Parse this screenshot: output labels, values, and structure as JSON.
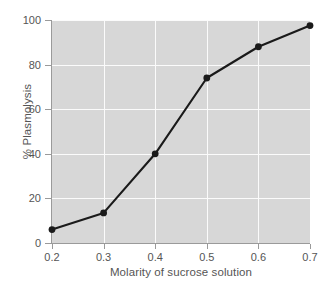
{
  "chart_data": {
    "type": "line",
    "title": "",
    "xlabel": "Molarity of sucrose solution",
    "ylabel": "% Plasmolysis",
    "x": [
      0.2,
      0.3,
      0.4,
      0.5,
      0.6,
      0.7
    ],
    "values": [
      6,
      13.5,
      40,
      74,
      88,
      97.5
    ],
    "series": [
      {
        "name": "% Plasmolysis",
        "values": [
          6,
          13.5,
          40,
          74,
          88,
          97.5
        ]
      }
    ],
    "xlim": [
      0.2,
      0.7
    ],
    "ylim": [
      0,
      100
    ],
    "xticks": [
      0.2,
      0.3,
      0.4,
      0.5,
      0.6,
      0.7
    ],
    "yticks": [
      0,
      20,
      40,
      60,
      80,
      100
    ],
    "xticklabels": [
      "0.2",
      "0.3",
      "0.4",
      "0.5",
      "0.6",
      "0.7"
    ],
    "yticklabels": [
      "0",
      "20",
      "40",
      "60",
      "80",
      "100"
    ],
    "grid": true,
    "grid_color": "#fbfbfb",
    "legend": false,
    "legend_position": "none",
    "marker": "circle",
    "line_color": "#1a1a1a",
    "marker_color": "#1a1a1a",
    "plot_background": "#d7d7d7",
    "figure_background": "#ffffff",
    "tick_label_color": "#555555",
    "axis_color": "#9a9a9a"
  }
}
